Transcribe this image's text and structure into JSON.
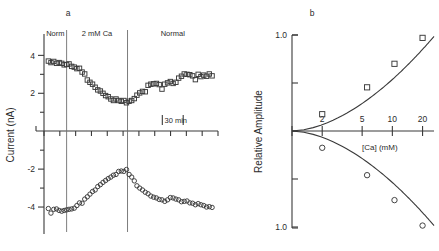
{
  "figure": {
    "panel_a_label": "a",
    "panel_b_label": "b"
  },
  "chart_data": [
    {
      "type": "scatter",
      "panel": "a",
      "title": "",
      "xlabel": "",
      "ylabel": "Current (nA)",
      "ylim": [
        -5.0,
        4.6
      ],
      "yticks": [
        4,
        2,
        -2,
        -4
      ],
      "ytick_labels": [
        "4",
        "2",
        "-2",
        "-4"
      ],
      "xlim": [
        0,
        100
      ],
      "grid": false,
      "legend": "none",
      "scalebar": {
        "label": "30 min",
        "x_start": 68,
        "x_end": 80
      },
      "epochs": [
        {
          "label": "Norm",
          "x_start": 0,
          "x_end": 13
        },
        {
          "label": "2 mM Ca",
          "x_start": 13,
          "x_end": 48
        },
        {
          "label": "Normal",
          "x_start": 48,
          "x_end": 100
        }
      ],
      "dividers": [
        13,
        48
      ],
      "series": [
        {
          "name": "outward-current-squares",
          "marker": "square",
          "x": [
            2.5,
            4.0,
            5.6,
            7.2,
            8.7,
            10.2,
            11.6,
            13.0,
            14.4,
            15.9,
            17.4,
            18.9,
            20.4,
            21.9,
            23.4,
            24.9,
            26.4,
            27.9,
            29.4,
            30.9,
            32.4,
            33.9,
            35.4,
            36.9,
            38.4,
            39.9,
            41.4,
            42.9,
            44.4,
            45.9,
            47.4,
            48.9,
            50.4,
            51.9,
            53.4,
            55.0,
            56.6,
            58.2,
            59.8,
            61.4,
            63.0,
            64.6,
            66.2,
            67.8,
            69.4,
            71.0,
            72.6,
            74.2,
            75.8,
            77.4,
            79.0,
            80.6,
            82.2,
            83.8,
            85.4,
            87.0,
            88.6,
            90.2,
            91.8,
            93.4,
            95.0,
            96.6
          ],
          "y": [
            3.7,
            3.62,
            3.68,
            3.58,
            3.62,
            3.58,
            3.5,
            3.52,
            3.55,
            3.42,
            3.38,
            3.3,
            3.32,
            3.12,
            3.02,
            2.7,
            2.58,
            2.48,
            2.32,
            2.18,
            2.12,
            2.0,
            1.88,
            1.82,
            1.7,
            1.62,
            1.7,
            1.62,
            1.58,
            1.62,
            1.5,
            1.58,
            1.62,
            1.72,
            1.9,
            2.02,
            2.1,
            2.08,
            2.42,
            2.48,
            2.5,
            2.52,
            2.46,
            2.22,
            2.48,
            2.55,
            2.62,
            2.52,
            2.58,
            2.8,
            2.9,
            3.02,
            3.0,
            2.98,
            2.92,
            2.72,
            3.0,
            2.88,
            2.96,
            2.9,
            3.02,
            2.92
          ]
        },
        {
          "name": "inward-current-circles",
          "marker": "circle",
          "x": [
            2.5,
            4.0,
            5.6,
            7.2,
            8.7,
            10.2,
            11.6,
            13.0,
            14.4,
            15.9,
            17.4,
            18.9,
            20.4,
            21.9,
            23.4,
            24.9,
            26.4,
            27.9,
            29.4,
            30.9,
            32.4,
            33.9,
            35.4,
            36.9,
            38.4,
            39.9,
            41.4,
            42.9,
            44.4,
            45.9,
            47.4,
            48.9,
            50.4,
            51.9,
            53.4,
            55.0,
            56.6,
            58.2,
            59.8,
            61.4,
            63.0,
            64.6,
            66.2,
            67.8,
            69.4,
            71.0,
            72.6,
            74.2,
            75.8,
            77.4,
            79.0,
            80.6,
            82.2,
            83.8,
            85.4,
            87.0,
            88.6,
            90.2,
            91.8,
            93.4,
            95.0,
            96.6
          ],
          "y": [
            -4.08,
            -4.32,
            -4.12,
            -4.1,
            -4.18,
            -4.22,
            -4.18,
            -4.15,
            -4.12,
            -4.1,
            -4.06,
            -3.92,
            -3.78,
            -3.8,
            -3.58,
            -3.46,
            -3.32,
            -3.18,
            -3.1,
            -2.92,
            -2.82,
            -2.7,
            -2.6,
            -2.5,
            -2.42,
            -2.32,
            -2.28,
            -2.12,
            -2.1,
            -2.12,
            -2.02,
            -2.28,
            -2.42,
            -2.62,
            -2.88,
            -3.0,
            -3.1,
            -3.22,
            -3.3,
            -3.42,
            -3.48,
            -3.52,
            -3.6,
            -3.62,
            -3.7,
            -3.62,
            -3.5,
            -3.52,
            -3.58,
            -3.62,
            -3.72,
            -3.7,
            -3.68,
            -3.78,
            -3.8,
            -3.88,
            -3.82,
            -3.88,
            -3.92,
            -4.0,
            -3.98,
            -4.02
          ]
        }
      ]
    },
    {
      "type": "scatter",
      "panel": "b",
      "title": "",
      "xlabel": "[Ca] (mM)",
      "ylabel": "Relative Amplitude",
      "xscale": "log",
      "xlim": [
        1,
        26
      ],
      "xticks": [
        1,
        2,
        5,
        10,
        20
      ],
      "xtick_labels": [
        "",
        "2",
        "5",
        "10",
        "20"
      ],
      "ylim": [
        -1.0,
        1.0
      ],
      "yticks": [
        1.0,
        0.5,
        0,
        -0.5,
        -1.0
      ],
      "ytick_labels": [
        "1.0",
        "",
        "",
        "",
        "1.0"
      ],
      "grid": false,
      "legend": "none",
      "series": [
        {
          "name": "relative-amplitude-squares",
          "marker": "square",
          "x": [
            2,
            5.6,
            10.5,
            20
          ],
          "y": [
            0.175,
            0.455,
            0.7,
            0.97
          ]
        },
        {
          "name": "relative-amplitude-circles",
          "marker": "circle",
          "x": [
            2,
            5.6,
            10.5,
            20
          ],
          "y": [
            -0.175,
            -0.46,
            -0.72,
            -0.985
          ]
        }
      ],
      "fit_curves": [
        {
          "name": "upper-fit",
          "direction": "up"
        },
        {
          "name": "lower-fit",
          "direction": "down"
        }
      ]
    }
  ]
}
